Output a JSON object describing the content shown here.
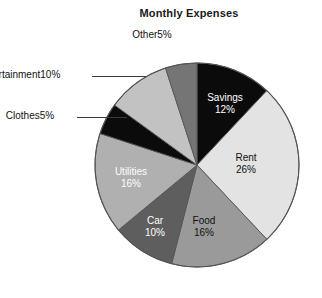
{
  "chart_data": {
    "type": "pie",
    "title": "Monthly Expenses",
    "xlabel": "",
    "ylabel": "",
    "legend": "none",
    "grid": false,
    "units": "percent",
    "start_angle_deg": 0,
    "direction": "clockwise",
    "categories": [
      "Savings",
      "Rent",
      "Food",
      "Car",
      "Utilities",
      "Clothes",
      "Entertainment",
      "Other"
    ],
    "values": [
      12,
      26,
      16,
      10,
      16,
      5,
      10,
      5
    ],
    "total": 100,
    "slices": [
      {
        "label": "Savings",
        "value": 12,
        "pct_text": "12%",
        "color": "#0b0b0b",
        "text_color": "#ffffff",
        "placement": "inside",
        "label_x": 225,
        "label_y": 92
      },
      {
        "label": "Rent",
        "value": 26,
        "pct_text": "26%",
        "color": "#e3e3e3",
        "text_color": "#111111",
        "placement": "inside",
        "label_x": 246,
        "label_y": 152
      },
      {
        "label": "Food",
        "value": 16,
        "pct_text": "16%",
        "color": "#9a9a9a",
        "text_color": "#111111",
        "placement": "inside",
        "label_x": 204,
        "label_y": 215
      },
      {
        "label": "Car",
        "value": 10,
        "pct_text": "10%",
        "color": "#5e5e5e",
        "text_color": "#ffffff",
        "placement": "inside",
        "label_x": 155,
        "label_y": 215
      },
      {
        "label": "Utilities",
        "value": 16,
        "pct_text": "16%",
        "color": "#b0b0b0",
        "text_color": "#ffffff",
        "placement": "inside",
        "label_x": 131,
        "label_y": 166
      },
      {
        "label": "Clothes",
        "value": 5,
        "pct_text": "5%",
        "color": "#0b0b0b",
        "text_color": "#111111",
        "placement": "callout",
        "label_x": 30,
        "label_y": 110
      },
      {
        "label": "Entertainment",
        "value": 10,
        "pct_text": "10%",
        "color": "#c2c2c2",
        "text_color": "#111111",
        "placement": "callout",
        "label_x": 18,
        "label_y": 69
      },
      {
        "label": "Other",
        "value": 5,
        "pct_text": "5%",
        "color": "#757575",
        "text_color": "#111111",
        "placement": "callout",
        "label_x": 152,
        "label_y": 29
      }
    ],
    "geometry": {
      "cx": 197,
      "cy": 165,
      "r": 102
    },
    "leaders": [
      {
        "for": "Entertainment",
        "x1": 92,
        "y1": 76,
        "x2": 146,
        "y2": 76
      },
      {
        "for": "Clothes",
        "x1": 77,
        "y1": 117,
        "x2": 127,
        "y2": 117
      }
    ],
    "colors": {
      "stroke": "#555555",
      "background": "#ffffff",
      "title_color": "#1a1a1a"
    }
  }
}
